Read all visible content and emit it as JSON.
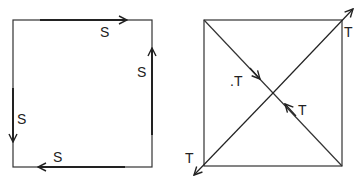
{
  "left_diagram": {
    "labels": [
      "S",
      "S",
      "S",
      "S"
    ],
    "description": "Square with four edge forces circulating"
  },
  "right_diagram": {
    "labels": [
      "T",
      "T",
      "T",
      "T"
    ],
    "dot_label": ".T",
    "description": "Square with diagonals and tension forces"
  },
  "colors": {
    "line": "#222222",
    "background": "#ffffff"
  }
}
